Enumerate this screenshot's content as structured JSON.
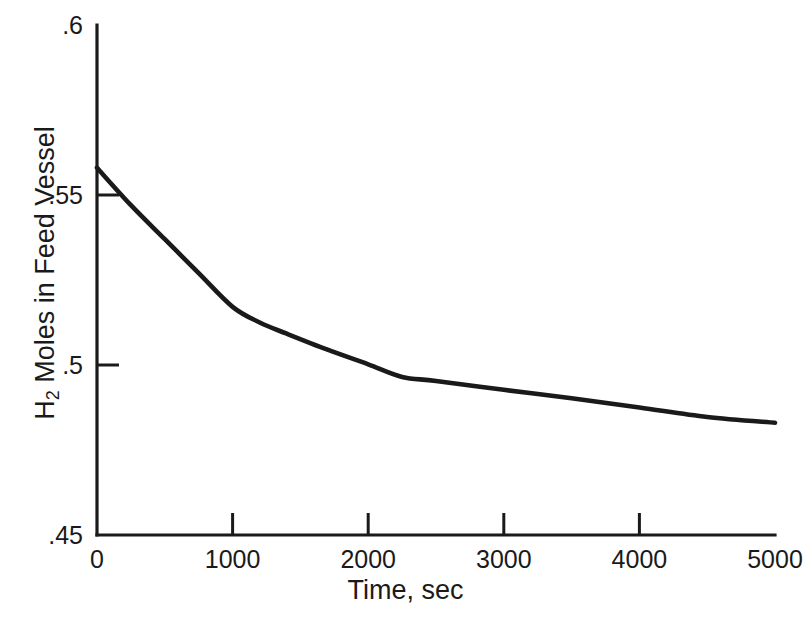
{
  "chart_data": {
    "type": "line",
    "title": "",
    "xlabel": "Time, sec",
    "ylabel_parts": {
      "prefix": "H",
      "subscript": "2",
      "suffix": " Moles in Feed Vessel"
    },
    "ylabel": "H2 Moles in Feed Vessel",
    "xlim": [
      0,
      5000
    ],
    "ylim": [
      0.45,
      0.6
    ],
    "grid": false,
    "legend": null,
    "xticks": [
      0,
      1000,
      2000,
      3000,
      4000,
      5000
    ],
    "xtick_labels": [
      "0",
      "1000",
      "2000",
      "3000",
      "4000",
      "5000"
    ],
    "yticks": [
      0.45,
      0.5,
      0.55,
      0.6
    ],
    "ytick_labels": [
      ".45",
      ".5",
      ".55",
      ".6"
    ],
    "series": [
      {
        "name": "H2 moles in feed vessel",
        "color": "#1a1a1a",
        "x": [
          0,
          250,
          500,
          750,
          1000,
          1200,
          1400,
          1700,
          2000,
          2250,
          2500,
          3000,
          3500,
          4000,
          4500,
          5000
        ],
        "y": [
          0.558,
          0.547,
          0.537,
          0.527,
          0.5171,
          0.5125,
          0.5092,
          0.5045,
          0.5002,
          0.4965,
          0.4953,
          0.4927,
          0.4902,
          0.4875,
          0.4847,
          0.483
        ]
      }
    ]
  },
  "axes_pixels": {
    "x0": 97,
    "x1": 775,
    "y_top": 25,
    "y_bottom": 535
  }
}
